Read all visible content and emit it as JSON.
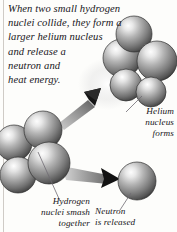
{
  "illustration": {
    "title": "nuclear-fusion-diagram",
    "intro_text": "When two small hydrogen\nnuclei collide, they form a\nlarger helium nucleus\nand release a\nneutron and\nheat energy.",
    "captions": {
      "helium": "Helium\nnucleus\nforms",
      "hydrogen": "Hydrogen\nnuclei smash\ntogether",
      "neutron": "Neutron\nis released"
    },
    "colors": {
      "background": "#fdfdfb",
      "text": "#17151a",
      "sphere_light": "#f2f2f2",
      "sphere_mid": "#a6a6a6",
      "sphere_dark": "#4a4a4a",
      "sphere_edge": "#2e2e2e",
      "arrow_dark": "#111111",
      "arrow_gray": "#8c8c8c",
      "leader_line": "#6f6b72",
      "border": "#cfcbc6"
    },
    "elements": {
      "helium_nucleus_label": "helium-nucleus-cluster",
      "hydrogen_nuclei_label": "hydrogen-nuclei-cluster",
      "neutron_label": "neutron-sphere",
      "fusion_arrow_label": "fusion-arrow",
      "neutron_arrow_label": "neutron-emission-arrow",
      "sphere_count_helium": 4,
      "sphere_count_hydrogen": 4
    }
  }
}
